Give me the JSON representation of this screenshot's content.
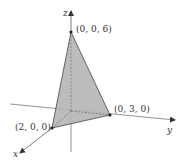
{
  "diagram": {
    "type": "3d-coordinate-plot",
    "axes": {
      "x": {
        "label": "x"
      },
      "y": {
        "label": "y"
      },
      "z": {
        "label": "z"
      }
    },
    "points": [
      {
        "id": "z-intercept",
        "label": "(0, 0, 6)"
      },
      {
        "id": "y-intercept",
        "label": "(0, 3, 0)"
      },
      {
        "id": "x-intercept",
        "label": "(2, 0, 0)"
      }
    ],
    "colors": {
      "fill": "#b5b5b5",
      "stroke": "#444444",
      "axis": "#555555"
    }
  }
}
